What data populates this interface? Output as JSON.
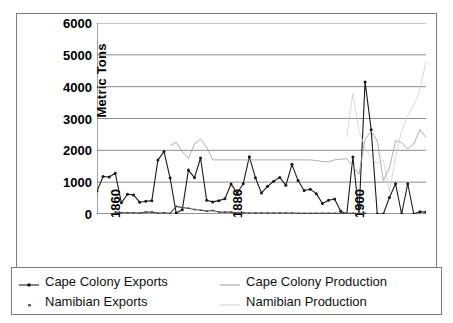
{
  "chart_data": {
    "type": "line",
    "title": "",
    "xlabel": "",
    "ylabel": "Metric Tons",
    "ylim": [
      0,
      6000
    ],
    "ytick_labels": [
      "0",
      "1000",
      "2000",
      "3000",
      "4000",
      "5000",
      "6000"
    ],
    "ytick_values": [
      0,
      1000,
      2000,
      3000,
      4000,
      5000,
      6000
    ],
    "xlim": [
      1859,
      1913
    ],
    "xtick_labels": [
      "1860",
      "1880",
      "1900"
    ],
    "xtick_values": [
      1860,
      1880,
      1900
    ],
    "grid": "horizontal",
    "legend_position": "bottom",
    "legend": [
      "Cape Colony Exports",
      "Cape Colony Production",
      "Namibian Exports",
      "Namibian Production"
    ],
    "series": [
      {
        "name": "Cape Colony Exports",
        "color": "#1a1a1a",
        "marker": "dot",
        "x": [
          1859,
          1860,
          1861,
          1862,
          1863,
          1864,
          1865,
          1866,
          1867,
          1868,
          1869,
          1870,
          1871,
          1872,
          1873,
          1874,
          1875,
          1876,
          1877,
          1878,
          1879,
          1880,
          1881,
          1882,
          1883,
          1884,
          1885,
          1886,
          1887,
          1888,
          1889,
          1890,
          1891,
          1892,
          1893,
          1894,
          1895,
          1896,
          1897,
          1898,
          1899,
          1900,
          1901,
          1902,
          1903,
          1904,
          1905,
          1906,
          1907,
          1908,
          1909,
          1910,
          1911,
          1912,
          1913
        ],
        "values": [
          720,
          1180,
          1160,
          1280,
          350,
          620,
          600,
          370,
          400,
          420,
          1700,
          1960,
          1130,
          30,
          130,
          1380,
          1140,
          1760,
          430,
          380,
          420,
          480,
          940,
          660,
          950,
          1800,
          1140,
          660,
          870,
          1030,
          1150,
          900,
          1560,
          1050,
          740,
          780,
          640,
          330,
          430,
          470,
          90,
          0,
          1790,
          0,
          4150,
          2650,
          0,
          0,
          520,
          950,
          0,
          950,
          0,
          70,
          60
        ]
      },
      {
        "name": "Cape Colony Production",
        "color": "#9a9a9a",
        "marker": "none",
        "x": [
          1871,
          1872,
          1873,
          1874,
          1875,
          1876,
          1877,
          1878,
          1893,
          1894,
          1895,
          1896,
          1897,
          1898,
          1899,
          1900,
          1901,
          1902,
          1903,
          1904,
          1905,
          1906,
          1907,
          1908,
          1909,
          1910,
          1911,
          1912,
          1913
        ],
        "values": [
          2150,
          2250,
          1950,
          1750,
          2200,
          2350,
          2100,
          1700,
          1700,
          1700,
          1680,
          1650,
          1640,
          1700,
          1720,
          1740,
          1500,
          1250,
          2350,
          2600,
          2300,
          1050,
          1450,
          2300,
          2250,
          2050,
          2200,
          2650,
          2400
        ]
      },
      {
        "name": "Namibian Exports",
        "color": "#4d4d4d",
        "marker": "tick",
        "x": [
          1862,
          1863,
          1864,
          1865,
          1866,
          1867,
          1868,
          1869,
          1870,
          1871,
          1872,
          1873,
          1874,
          1875,
          1876,
          1877,
          1878,
          1879,
          1880,
          1881,
          1882,
          1883,
          1884,
          1885,
          1886,
          1887,
          1888,
          1889,
          1890,
          1891,
          1892,
          1893,
          1894,
          1895,
          1896,
          1897,
          1898,
          1899,
          1900,
          1901,
          1902,
          1903
        ],
        "values": [
          60,
          40,
          40,
          40,
          30,
          60,
          60,
          30,
          40,
          20,
          240,
          200,
          180,
          140,
          120,
          90,
          110,
          60,
          60,
          60,
          40,
          40,
          30,
          30,
          30,
          30,
          30,
          30,
          30,
          30,
          20,
          20,
          20,
          20,
          20,
          20,
          20,
          20,
          20,
          20,
          20,
          20
        ]
      },
      {
        "name": "Namibian Production",
        "color": "#cfcfcf",
        "marker": "none",
        "x": [
          1900,
          1901,
          1902,
          1903,
          1904,
          1905,
          1906,
          1907,
          1908,
          1909,
          1910,
          1911,
          1912,
          1913
        ],
        "values": [
          2400,
          3800,
          2600,
          2100,
          1750,
          1600,
          1700,
          700,
          1800,
          2600,
          3100,
          3400,
          3900,
          4800
        ]
      }
    ]
  },
  "legend": {
    "items": [
      {
        "label": "Cape Colony Exports",
        "key": "line-with-dot-marker"
      },
      {
        "label": "Cape Colony Production",
        "key": "light-gray-line"
      },
      {
        "label": "Namibian Exports",
        "key": "small-dot-marker"
      },
      {
        "label": "Namibian Production",
        "key": "very-light-line"
      }
    ]
  }
}
